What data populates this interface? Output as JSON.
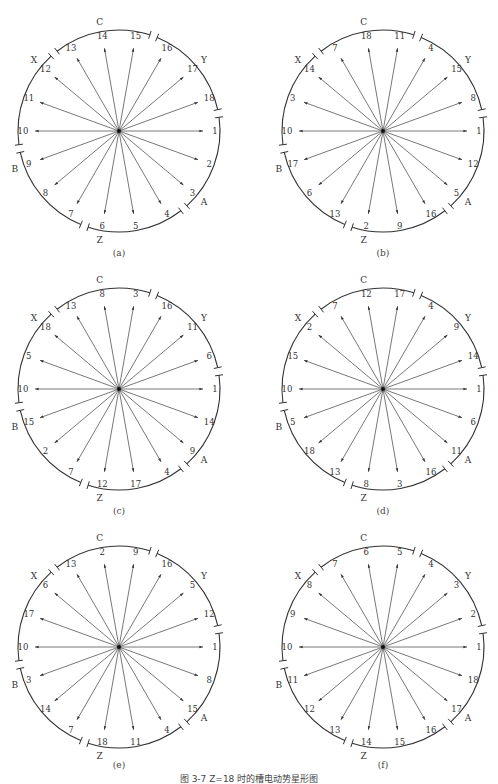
{
  "caption": "图 3-7  Z=18 时的槽电动势星形图",
  "phase_labels": [
    "A",
    "Z",
    "B",
    "X",
    "C",
    "Y"
  ],
  "diagrams": [
    {
      "id": "a",
      "label": "(a)",
      "cx": 119,
      "cy": 131,
      "label_y": 254,
      "order": [
        1,
        2,
        3,
        4,
        5,
        6,
        7,
        8,
        9,
        10,
        11,
        12,
        13,
        14,
        15,
        16,
        17,
        18
      ]
    },
    {
      "id": "b",
      "label": "(b)",
      "cx": 383,
      "cy": 131,
      "label_y": 254,
      "order": [
        1,
        12,
        5,
        16,
        9,
        2,
        13,
        6,
        17,
        10,
        3,
        14,
        7,
        18,
        11,
        4,
        15,
        8
      ]
    },
    {
      "id": "c",
      "label": "(c)",
      "cx": 119,
      "cy": 389,
      "label_y": 512,
      "order": [
        1,
        14,
        9,
        4,
        17,
        12,
        7,
        2,
        15,
        10,
        5,
        18,
        13,
        8,
        3,
        16,
        11,
        6
      ]
    },
    {
      "id": "d",
      "label": "(d)",
      "cx": 383,
      "cy": 389,
      "label_y": 512,
      "order": [
        1,
        6,
        11,
        16,
        3,
        8,
        13,
        18,
        5,
        10,
        15,
        2,
        7,
        12,
        17,
        4,
        9,
        14
      ]
    },
    {
      "id": "e",
      "label": "(e)",
      "cx": 119,
      "cy": 647,
      "label_y": 766,
      "order": [
        1,
        8,
        15,
        4,
        11,
        18,
        7,
        14,
        3,
        10,
        17,
        6,
        13,
        2,
        9,
        16,
        5,
        12
      ]
    },
    {
      "id": "f",
      "label": "(f)",
      "cx": 383,
      "cy": 647,
      "label_y": 766,
      "order": [
        1,
        18,
        17,
        16,
        15,
        14,
        13,
        12,
        11,
        10,
        9,
        8,
        7,
        6,
        5,
        4,
        3,
        2
      ]
    }
  ],
  "chart_data": {
    "type": "diagram",
    "title": "图 3-7  Z=18 时的槽电动势星形图",
    "angle_step_deg": 20,
    "phase_belts_clockwise_from_A": [
      "A",
      "Z",
      "B",
      "X",
      "C",
      "Y"
    ],
    "diagrams": {
      "a": [
        1,
        2,
        3,
        4,
        5,
        6,
        7,
        8,
        9,
        10,
        11,
        12,
        13,
        14,
        15,
        16,
        17,
        18
      ],
      "b": [
        1,
        12,
        5,
        16,
        9,
        2,
        13,
        6,
        17,
        10,
        3,
        14,
        7,
        18,
        11,
        4,
        15,
        8
      ],
      "c": [
        1,
        14,
        9,
        4,
        17,
        12,
        7,
        2,
        15,
        10,
        5,
        18,
        13,
        8,
        3,
        16,
        11,
        6
      ],
      "d": [
        1,
        6,
        11,
        16,
        3,
        8,
        13,
        18,
        5,
        10,
        15,
        2,
        7,
        12,
        17,
        4,
        9,
        14
      ],
      "e": [
        1,
        8,
        15,
        4,
        11,
        18,
        7,
        14,
        3,
        10,
        17,
        6,
        13,
        2,
        9,
        16,
        5,
        12
      ],
      "f": [
        1,
        18,
        17,
        16,
        15,
        14,
        13,
        12,
        11,
        10,
        9,
        8,
        7,
        6,
        5,
        4,
        3,
        2
      ]
    }
  }
}
